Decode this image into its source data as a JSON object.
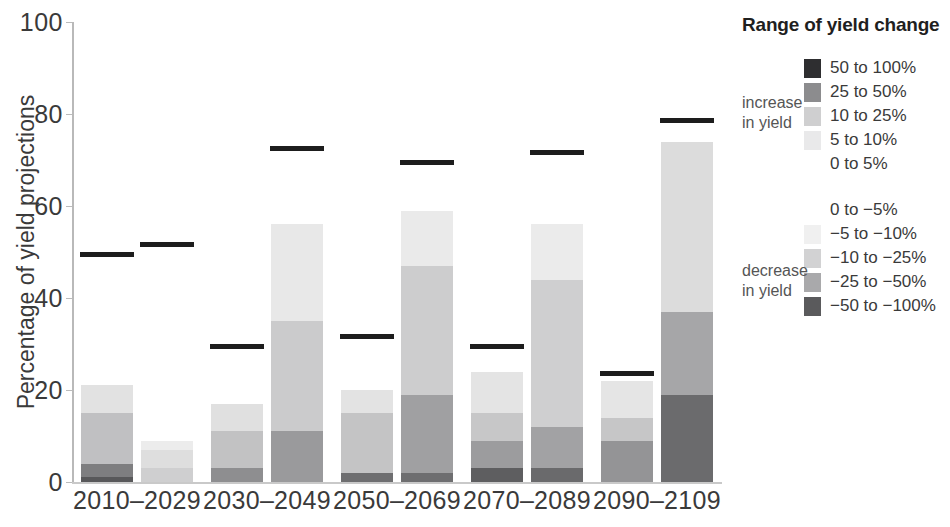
{
  "chart_data": {
    "type": "bar",
    "subtype": "stacked-bar-grouped",
    "title": "",
    "xlabel": "",
    "ylabel": "Percentage of yield projections",
    "ylim": [
      0,
      100
    ],
    "yticks": [
      0,
      20,
      40,
      60,
      80,
      100
    ],
    "grid": false,
    "legend_position": "right",
    "legend_title": "Range of yield change",
    "categories": [
      "2010–2029",
      "2030–2049",
      "2050–2069",
      "2070–2089",
      "2090–2109"
    ],
    "bars_per_category": 2,
    "stack_order_bottom_to_top": [
      "-50 to -100%",
      "-25 to -50%",
      "-10 to -25%",
      "-5 to -10%",
      "0 to -5%",
      "0 to 5%",
      "5 to 10%",
      "10 to 25%",
      "25 to 50%",
      "50 to 100%"
    ],
    "series": [
      {
        "name": "-50 to -100%",
        "color": "#58585a",
        "values": [
          [
            0,
            0
          ],
          [
            0,
            0
          ],
          [
            0,
            0
          ],
          [
            0,
            0
          ],
          [
            0,
            19
          ]
        ]
      },
      {
        "name": "-25 to -50%",
        "color": "#8c8c8e",
        "values": [
          [
            4,
            0
          ],
          [
            3,
            11
          ],
          [
            2,
            19
          ],
          [
            3,
            12
          ],
          [
            9,
            18
          ]
        ]
      },
      {
        "name": "-10 to -25%",
        "color": "#b9b9bb",
        "values": [
          [
            11,
            3
          ],
          [
            8,
            24
          ],
          [
            13,
            28
          ],
          [
            6,
            32
          ],
          [
            5,
            37
          ]
        ]
      },
      {
        "name": "-5 to -10%",
        "color": "#d6d6d7",
        "values": [
          [
            6,
            4
          ],
          [
            7,
            9
          ],
          [
            5,
            12
          ],
          [
            9,
            12
          ],
          [
            10,
            0
          ]
        ]
      },
      {
        "name": "0 to -5%",
        "color": "#ededed",
        "values": [
          [
            0,
            0
          ],
          [
            0,
            0
          ],
          [
            0,
            0
          ],
          [
            0,
            0
          ],
          [
            0,
            0
          ]
        ]
      }
    ],
    "bar_segments": [
      {
        "category": "2010–2029",
        "bars": [
          {
            "total_marker": 49,
            "segments": [
              {
                "label": "-50 to -100%",
                "from": 0,
                "to": 1,
                "color": "#58585a"
              },
              {
                "label": "-25 to -50%",
                "from": 1,
                "to": 4,
                "color": "#7e7e80"
              },
              {
                "label": "-10 to -25%",
                "from": 4,
                "to": 15,
                "color": "#c0c0c2"
              },
              {
                "label": "-5 to -10%",
                "from": 15,
                "to": 21,
                "color": "#e2e2e2"
              }
            ]
          },
          {
            "total_marker": 51,
            "segments": [
              {
                "label": "-25 to -50%",
                "from": 0,
                "to": 3,
                "color": "#cfcfd0"
              },
              {
                "label": "-10 to -25%",
                "from": 3,
                "to": 7,
                "color": "#dedede"
              },
              {
                "label": "-5 to -10%",
                "from": 7,
                "to": 9,
                "color": "#ececec"
              }
            ]
          }
        ]
      },
      {
        "category": "2030–2049",
        "bars": [
          {
            "total_marker": 29,
            "segments": [
              {
                "label": "-25 to -50%",
                "from": 0,
                "to": 3,
                "color": "#8e8e90"
              },
              {
                "label": "-10 to -25%",
                "from": 3,
                "to": 11,
                "color": "#c2c2c3"
              },
              {
                "label": "-5 to -10%",
                "from": 11,
                "to": 17,
                "color": "#e0e0e0"
              }
            ]
          },
          {
            "total_marker": 72,
            "segments": [
              {
                "label": "-25 to -50%",
                "from": 0,
                "to": 11,
                "color": "#9a9a9c"
              },
              {
                "label": "-10 to -25%",
                "from": 11,
                "to": 35,
                "color": "#cbcbcc"
              },
              {
                "label": "-5 to -10%",
                "from": 35,
                "to": 56,
                "color": "#e8e8e8"
              }
            ]
          }
        ]
      },
      {
        "category": "2050–2069",
        "bars": [
          {
            "total_marker": 31,
            "segments": [
              {
                "label": "-50 to -100%",
                "from": 0,
                "to": 2,
                "color": "#6e6e70"
              },
              {
                "label": "-10 to -25%",
                "from": 2,
                "to": 15,
                "color": "#c4c4c5"
              },
              {
                "label": "-5 to -10%",
                "from": 15,
                "to": 20,
                "color": "#e3e3e3"
              }
            ]
          },
          {
            "total_marker": 69,
            "segments": [
              {
                "label": "-50 to -100%",
                "from": 0,
                "to": 2,
                "color": "#6e6e70"
              },
              {
                "label": "-25 to -50%",
                "from": 2,
                "to": 19,
                "color": "#a0a0a2"
              },
              {
                "label": "-10 to -25%",
                "from": 19,
                "to": 47,
                "color": "#cdcdce"
              },
              {
                "label": "-5 to -10%",
                "from": 47,
                "to": 59,
                "color": "#eaeaea"
              }
            ]
          }
        ]
      },
      {
        "category": "2070–2089",
        "bars": [
          {
            "total_marker": 29,
            "segments": [
              {
                "label": "-50 to -100%",
                "from": 0,
                "to": 3,
                "color": "#5e5e60"
              },
              {
                "label": "-25 to -50%",
                "from": 3,
                "to": 9,
                "color": "#9c9c9e"
              },
              {
                "label": "-10 to -25%",
                "from": 9,
                "to": 15,
                "color": "#c7c7c8"
              },
              {
                "label": "-5 to -10%",
                "from": 15,
                "to": 24,
                "color": "#e4e4e4"
              }
            ]
          },
          {
            "total_marker": 71,
            "segments": [
              {
                "label": "-50 to -100%",
                "from": 0,
                "to": 3,
                "color": "#6a6a6c"
              },
              {
                "label": "-25 to -50%",
                "from": 3,
                "to": 12,
                "color": "#a2a2a4"
              },
              {
                "label": "-10 to -25%",
                "from": 12,
                "to": 44,
                "color": "#cfcfd0"
              },
              {
                "label": "-5 to -10%",
                "from": 44,
                "to": 56,
                "color": "#ebebeb"
              }
            ]
          }
        ]
      },
      {
        "category": "2090–2109",
        "bars": [
          {
            "total_marker": 23,
            "segments": [
              {
                "label": "-25 to -50%",
                "from": 0,
                "to": 9,
                "color": "#949496"
              },
              {
                "label": "-10 to -25%",
                "from": 9,
                "to": 14,
                "color": "#c6c6c7"
              },
              {
                "label": "-5 to -10%",
                "from": 14,
                "to": 22,
                "color": "#e5e5e5"
              }
            ]
          },
          {
            "total_marker": 78,
            "segments": [
              {
                "label": "-50 to -100%",
                "from": 0,
                "to": 19,
                "color": "#6b6b6d"
              },
              {
                "label": "-25 to -50%",
                "from": 19,
                "to": 37,
                "color": "#a6a6a8"
              },
              {
                "label": "-10 to -25%",
                "from": 37,
                "to": 74,
                "color": "#dcdcdc"
              }
            ]
          }
        ]
      }
    ]
  },
  "axis": {
    "y_title": "Percentage of yield projections",
    "y_ticks": [
      "100",
      "80",
      "60",
      "40",
      "20",
      "0"
    ],
    "x_labels": [
      "2010–2029",
      "2030–2049",
      "2050–2069",
      "2070–2089",
      "2090–2109"
    ]
  },
  "legend": {
    "title": "Range of yield change",
    "increase_label_line1": "increase",
    "increase_label_line2": "in yield",
    "decrease_label_line1": "decrease",
    "decrease_label_line2": "in yield",
    "increase_items": [
      {
        "label": "50 to 100%",
        "color": "#2e2e30"
      },
      {
        "label": "25 to 50%",
        "color": "#8c8c8e"
      },
      {
        "label": "10 to 25%",
        "color": "#cfcfd0"
      },
      {
        "label": "5 to 10%",
        "color": "#e9e9ea"
      },
      {
        "label": "0 to 5%",
        "color": "#ffffff"
      }
    ],
    "decrease_items": [
      {
        "label": "0 to −5%",
        "color": "#ffffff"
      },
      {
        "label": "−5 to −10%",
        "color": "#f0f0f0"
      },
      {
        "label": "−10 to −25%",
        "color": "#d2d2d3"
      },
      {
        "label": "−25 to −50%",
        "color": "#a9a9ab"
      },
      {
        "label": "−50 to −100%",
        "color": "#5a5a5c"
      }
    ]
  }
}
